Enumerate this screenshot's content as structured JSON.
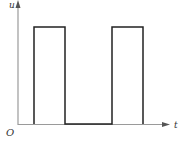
{
  "diagram": {
    "title": "",
    "type": "square-wave pulse plot",
    "axes": {
      "y_label": "u",
      "x_label": "t",
      "origin_label": "O",
      "axis_color": "#999999"
    },
    "waveform": {
      "color": "#222222",
      "pulses": [
        {
          "start_px": 34,
          "end_px": 65
        },
        {
          "start_px": 112,
          "end_px": 143
        }
      ],
      "high_level_px": 27,
      "low_level_px": 124
    }
  }
}
